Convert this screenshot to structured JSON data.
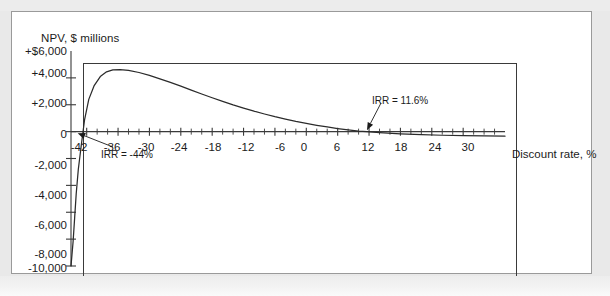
{
  "figure": {
    "background_color": "#ffffff",
    "page_color": "#e9e9e9",
    "border_color": "#9a9a9a"
  },
  "chart_data": {
    "type": "line",
    "title": "",
    "subtitle": "",
    "ylabel": "NPV, $ millions",
    "xlabel": "Discount rate, %",
    "grid": false,
    "legend": null,
    "axis_color": "#3a3a3a",
    "curve_color": "#2b2b2b",
    "xlim": [
      -45,
      38
    ],
    "ylim": [
      -10000,
      6000
    ],
    "x_tick_step": 2,
    "x_labeled_step": 6,
    "y_tick_step": 2000,
    "x_tick_labels": [
      "-42",
      "-36",
      "-30",
      "-24",
      "-18",
      "-12",
      "-6",
      "0",
      "6",
      "12",
      "18",
      "24",
      "30"
    ],
    "x_tick_values": [
      -42,
      -36,
      -30,
      -24,
      -18,
      -12,
      -6,
      0,
      6,
      12,
      18,
      24,
      30
    ],
    "y_tick_labels": [
      "+$6,000",
      "+4,000",
      "+2,000",
      "0",
      "-2,000",
      "-4,000",
      "-6,000",
      "-8,000",
      "-10,000"
    ],
    "y_tick_values": [
      6000,
      4000,
      2000,
      0,
      -2000,
      -4000,
      -6000,
      -8000,
      -10000
    ],
    "series": [
      {
        "name": "NPV profile",
        "x": [
          -45.0,
          -44.6,
          -44.3,
          -44.0,
          -43.6,
          -43.0,
          -42.4,
          -41.6,
          -40.6,
          -39.4,
          -38.2,
          -37.0,
          -35.6,
          -34.0,
          -32.0,
          -30.0,
          -28.0,
          -26.0,
          -24.0,
          -22.0,
          -20.0,
          -18.0,
          -16.0,
          -14.0,
          -12.0,
          -10.0,
          -8.0,
          -6.0,
          -4.0,
          -2.0,
          0.0,
          2.0,
          4.0,
          6.0,
          8.0,
          10.0,
          11.6,
          14.0,
          18.0,
          22.0,
          26.0,
          30.0,
          34.0,
          38.0
        ],
        "y": [
          -10000,
          -8200,
          -6400,
          -4600,
          -2800,
          -900,
          900,
          2400,
          3400,
          4100,
          4450,
          4600,
          4620,
          4560,
          4400,
          4180,
          3930,
          3660,
          3380,
          3090,
          2800,
          2520,
          2250,
          1990,
          1750,
          1520,
          1310,
          1110,
          930,
          760,
          610,
          470,
          345,
          230,
          130,
          40,
          0,
          -70,
          -160,
          -225,
          -270,
          -300,
          -320,
          -335
        ]
      }
    ],
    "annotations": [
      {
        "name": "irr-negative",
        "label": "IRR = -44%",
        "x_value": -44,
        "y_value": 0,
        "text_x": 101,
        "text_y": 149
      },
      {
        "name": "irr-positive",
        "label": "IRR = 11.6%",
        "x_value": 11.6,
        "y_value": 0,
        "text_x": 372,
        "text_y": 95
      }
    ]
  }
}
